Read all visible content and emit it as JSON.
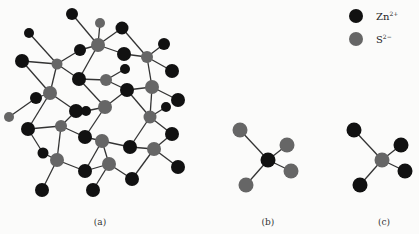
{
  "legend": {
    "items": [
      {
        "label": "Zn",
        "charge": "2+",
        "color": "#111111",
        "species": "zinc-ion"
      },
      {
        "label": "S",
        "charge": "2−",
        "color": "#666666",
        "species": "sulfide-ion"
      }
    ]
  },
  "panels": [
    {
      "id": "a",
      "caption": "(a)",
      "description": "Zinc blende lattice"
    },
    {
      "id": "b",
      "caption": "(b)",
      "description": "Zn2+ tetrahedrally coordinated by four S2-"
    },
    {
      "id": "c",
      "caption": "(c)",
      "description": "S2- tetrahedrally coordinated by four Zn2+"
    }
  ],
  "colors": {
    "zn": "#111111",
    "s": "#666666",
    "bond": "#333333",
    "background": "#fbfbfa"
  }
}
